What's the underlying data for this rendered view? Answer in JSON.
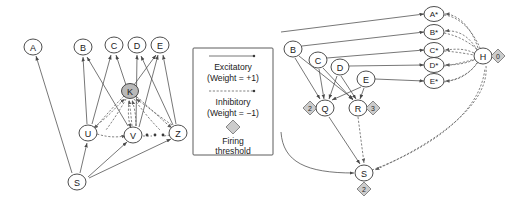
{
  "figure": {
    "title": "",
    "panels": [
      {
        "id": "left-panel",
        "name": "single-layer-network",
        "nodes": [
          {
            "id": "A",
            "label": "A",
            "x": 33,
            "y": 47,
            "shaded": false,
            "threshold": null
          },
          {
            "id": "B",
            "label": "B",
            "x": 83,
            "y": 47,
            "shaded": false,
            "threshold": null
          },
          {
            "id": "C",
            "label": "C",
            "x": 114,
            "y": 45,
            "shaded": false,
            "threshold": null
          },
          {
            "id": "D",
            "label": "D",
            "x": 137,
            "y": 45,
            "shaded": false,
            "threshold": null
          },
          {
            "id": "E",
            "label": "E",
            "x": 160,
            "y": 45,
            "shaded": false,
            "threshold": null
          },
          {
            "id": "K",
            "label": "K",
            "x": 130,
            "y": 91,
            "shaded": true,
            "threshold": null
          },
          {
            "id": "U",
            "label": "U",
            "x": 88,
            "y": 133,
            "shaded": false,
            "threshold": null
          },
          {
            "id": "V",
            "label": "V",
            "x": 133,
            "y": 135,
            "shaded": false,
            "threshold": null
          },
          {
            "id": "Z",
            "label": "Z",
            "x": 178,
            "y": 133,
            "shaded": false,
            "threshold": null
          },
          {
            "id": "S",
            "label": "S",
            "x": 77,
            "y": 182,
            "shaded": false,
            "threshold": null
          }
        ],
        "ellipsis_dots": 3
      },
      {
        "id": "right-panel",
        "name": "two-layer-threshold-network",
        "nodes": [
          {
            "id": "Astar",
            "label": "A*",
            "x": 434,
            "y": 14,
            "shaded": false,
            "threshold": null
          },
          {
            "id": "Bstar",
            "label": "B*",
            "x": 434,
            "y": 32,
            "shaded": false,
            "threshold": null
          },
          {
            "id": "Cstar",
            "label": "C*",
            "x": 434,
            "y": 50,
            "shaded": false,
            "threshold": null
          },
          {
            "id": "Dstar",
            "label": "D*",
            "x": 434,
            "y": 65,
            "shaded": false,
            "threshold": null
          },
          {
            "id": "Estar",
            "label": "E*",
            "x": 434,
            "y": 81,
            "shaded": false,
            "threshold": null
          },
          {
            "id": "H",
            "label": "H",
            "x": 483,
            "y": 56,
            "shaded": false,
            "threshold": "0"
          },
          {
            "id": "B",
            "label": "B",
            "x": 293,
            "y": 49,
            "shaded": false,
            "threshold": null
          },
          {
            "id": "C",
            "label": "C",
            "x": 318,
            "y": 60,
            "shaded": false,
            "threshold": null
          },
          {
            "id": "D",
            "label": "D",
            "x": 340,
            "y": 67,
            "shaded": false,
            "threshold": null
          },
          {
            "id": "E",
            "label": "E",
            "x": 366,
            "y": 79,
            "shaded": false,
            "threshold": null
          },
          {
            "id": "Q",
            "label": "Q",
            "x": 325,
            "y": 108,
            "shaded": false,
            "threshold": "2"
          },
          {
            "id": "R",
            "label": "R",
            "x": 358,
            "y": 108,
            "shaded": false,
            "threshold": "3"
          },
          {
            "id": "S",
            "label": "S",
            "x": 364,
            "y": 173,
            "shaded": false,
            "threshold": "2"
          }
        ]
      }
    ]
  },
  "legend": {
    "name": "edge-type-legend",
    "entries": [
      {
        "id": "excitatory",
        "arrow": "solid-arrow",
        "line1": "Excitatory",
        "line2": "(Weight = +1)"
      },
      {
        "id": "inhibitory",
        "arrow": "dashed-arrow",
        "line1": "Inhibitory",
        "line2": "(Weight = −1)"
      },
      {
        "id": "threshold",
        "arrow": "diamond-glyph",
        "line1": "Firing",
        "line2": "threshold"
      }
    ]
  },
  "colors": {
    "background": "#ffffff",
    "stroke": "#4a4a4a",
    "node_fill": "#ffffff",
    "node_shaded_fill": "#b9b9b9",
    "diamond_fill": "#cccccc",
    "text": "#1a1a1a"
  }
}
